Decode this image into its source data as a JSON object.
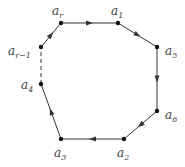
{
  "diagram": {
    "title": "",
    "nodes": [
      {
        "id": "ar",
        "label": "a",
        "sub": "r",
        "x": 61,
        "y": 23,
        "lx": 52,
        "ly": 15
      },
      {
        "id": "a1",
        "label": "a",
        "sub": "1",
        "x": 118,
        "y": 23,
        "lx": 111,
        "ly": 15
      },
      {
        "id": "a5",
        "label": "a",
        "sub": "5",
        "x": 157,
        "y": 47,
        "lx": 165,
        "ly": 55
      },
      {
        "id": "a6",
        "label": "a",
        "sub": "6",
        "x": 157,
        "y": 111,
        "lx": 165,
        "ly": 119
      },
      {
        "id": "a2",
        "label": "a",
        "sub": "2",
        "x": 124,
        "y": 139,
        "lx": 117,
        "ly": 157
      },
      {
        "id": "a3",
        "label": "a",
        "sub": "3",
        "x": 61,
        "y": 139,
        "lx": 54,
        "ly": 157
      },
      {
        "id": "a4",
        "label": "a",
        "sub": "4",
        "x": 41,
        "y": 84,
        "lx": 21,
        "ly": 89
      },
      {
        "id": "ar1",
        "label": "a",
        "sub": "r−1",
        "x": 41,
        "y": 47,
        "lx": 8,
        "ly": 55
      }
    ],
    "edges": [
      {
        "from": "ar",
        "to": "a1",
        "style": "solid",
        "arrow": true
      },
      {
        "from": "a1",
        "to": "a5",
        "style": "solid",
        "arrow": true
      },
      {
        "from": "a5",
        "to": "a6",
        "style": "solid",
        "arrow": true
      },
      {
        "from": "a6",
        "to": "a2",
        "style": "solid",
        "arrow": true
      },
      {
        "from": "a2",
        "to": "a3",
        "style": "solid",
        "arrow": true
      },
      {
        "from": "a3",
        "to": "a4",
        "style": "solid",
        "arrow": true
      },
      {
        "from": "a4",
        "to": "ar1",
        "style": "dashed",
        "arrow": false
      },
      {
        "from": "ar1",
        "to": "ar",
        "style": "solid",
        "arrow": true
      }
    ],
    "colors": {
      "edge": "#333333",
      "node": "#111111",
      "label": "#444444"
    }
  }
}
